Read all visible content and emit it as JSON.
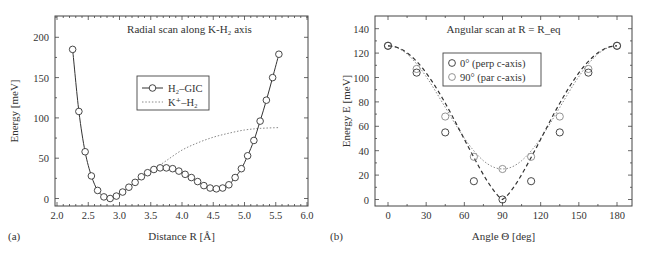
{
  "chart_data": [
    {
      "panel_label": "(a)",
      "type": "line",
      "title": "Radial scan along K-H₂ axis",
      "xlabel": "Distance R [Å]",
      "ylabel": "Energy [meV]",
      "xlim": [
        2.0,
        6.0
      ],
      "ylim": [
        -10,
        225
      ],
      "xticks": [
        2.0,
        2.5,
        3.0,
        3.5,
        4.0,
        4.5,
        5.0,
        5.5,
        6.0
      ],
      "xtick_labels": [
        "2.0",
        "2.5",
        "3.0",
        "3.5",
        "4.0",
        "4.5",
        "5.0",
        "5.5",
        "6.0"
      ],
      "yticks": [
        0,
        50,
        100,
        150,
        200
      ],
      "ytick_labels": [
        "0",
        "50",
        "100",
        "150",
        "200"
      ],
      "grid": false,
      "legend_position": "center",
      "series": [
        {
          "name": "H₂–GIC",
          "style": "solid line with open circle markers",
          "color": "#333333",
          "x": [
            2.25,
            2.35,
            2.45,
            2.55,
            2.65,
            2.75,
            2.85,
            2.95,
            3.05,
            3.15,
            3.25,
            3.35,
            3.45,
            3.55,
            3.65,
            3.75,
            3.85,
            3.95,
            4.05,
            4.15,
            4.25,
            4.35,
            4.45,
            4.55,
            4.65,
            4.75,
            4.85,
            4.95,
            5.05,
            5.15,
            5.25,
            5.35,
            5.45,
            5.55
          ],
          "y": [
            185,
            108,
            58,
            28,
            10,
            2,
            0,
            3,
            8,
            14,
            20,
            27,
            32,
            36,
            38,
            38,
            37,
            34,
            30,
            26,
            21,
            16,
            13,
            12,
            13,
            17,
            26,
            37,
            53,
            72,
            96,
            122,
            150,
            179
          ]
        },
        {
          "name": "K⁺–H₂",
          "style": "dotted line",
          "color": "#777777",
          "x": [
            3.55,
            3.75,
            4.0,
            4.25,
            4.5,
            4.75,
            5.0,
            5.25,
            5.55
          ],
          "y": [
            36,
            47,
            60,
            69,
            76,
            81,
            85,
            87,
            88
          ]
        }
      ]
    },
    {
      "panel_label": "(b)",
      "type": "scatter",
      "title": "Angular scan at R = R_eq",
      "xlabel": "Angle Θ [deg]",
      "ylabel": "Energy E [meV]",
      "xlim": [
        -10,
        190
      ],
      "ylim": [
        -5,
        150
      ],
      "xticks": [
        0,
        30,
        60,
        90,
        120,
        150,
        180
      ],
      "xtick_labels": [
        "0",
        "30",
        "60",
        "90",
        "120",
        "150",
        "180"
      ],
      "yticks": [
        0,
        20,
        40,
        60,
        80,
        100,
        120,
        140
      ],
      "ytick_labels": [
        "0",
        "20",
        "40",
        "60",
        "80",
        "100",
        "120",
        "140"
      ],
      "grid": false,
      "legend_position": "upper center",
      "series": [
        {
          "name": "0° (perp c-axis)",
          "style": "open circles, dark, with dashed fit line",
          "color": "#333333",
          "x": [
            0,
            22.5,
            45,
            67.5,
            90,
            112.5,
            135,
            157.5,
            180
          ],
          "y": [
            126,
            104,
            55,
            15,
            0,
            15,
            55,
            104,
            126
          ]
        },
        {
          "name": "90° (par c-axis)",
          "style": "open circles, gray, with dotted fit line",
          "color": "#888888",
          "x": [
            0,
            22.5,
            45,
            67.5,
            90,
            112.5,
            135,
            157.5,
            180
          ],
          "y": [
            126,
            107,
            68,
            35,
            25,
            35,
            68,
            107,
            126
          ]
        }
      ]
    }
  ]
}
